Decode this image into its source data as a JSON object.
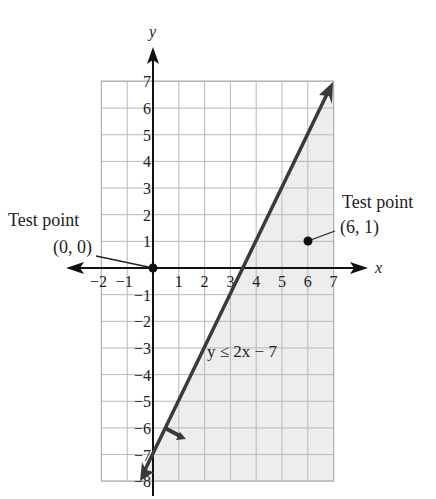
{
  "chart_data": {
    "type": "line",
    "title": "",
    "xlabel": "x",
    "ylabel": "y",
    "xlim": [
      -2,
      7
    ],
    "ylim": [
      -8,
      7
    ],
    "grid": true,
    "x_ticks": [
      "−2",
      "−1",
      "1",
      "2",
      "3",
      "4",
      "5",
      "6",
      "7"
    ],
    "y_ticks": [
      "7",
      "6",
      "5",
      "4",
      "3",
      "2",
      "1",
      "−1",
      "−2",
      "−3",
      "−4",
      "−5",
      "−6",
      "−7",
      "−8"
    ],
    "boundary_line": {
      "equation": "y = 2x − 7",
      "points": [
        [
          -0.5,
          -8
        ],
        [
          7,
          7
        ]
      ],
      "style": "solid"
    },
    "inequality_label": "y ≤ 2x − 7",
    "shaded_region": "below-right of line (y ≤ 2x − 7)",
    "test_points": [
      {
        "label_line1": "Test point",
        "label_line2": "(0, 0)",
        "x": 0,
        "y": 0
      },
      {
        "label_line1": "Test point",
        "label_line2": "(6, 1)",
        "x": 6,
        "y": 1
      }
    ],
    "colors": {
      "shade": "#ededed",
      "line": "#3a3a3a",
      "grid": "#b8b8b8",
      "axis": "#111111"
    }
  }
}
